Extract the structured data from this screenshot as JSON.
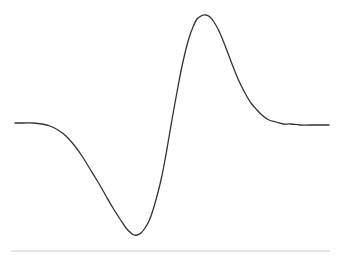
{
  "figure": {
    "background_color": "#ffffff",
    "width": 341,
    "height": 261,
    "title": "",
    "subtitle": ""
  },
  "curve": {
    "name": "wavelet-curve",
    "stroke_color": "#333333",
    "stroke_width": 1.3,
    "style": "solid"
  },
  "baseline": {
    "name": "baseline-rule",
    "stroke_color": "#cccccc",
    "stroke_width": 1,
    "x_start": 11,
    "x_end": 330,
    "y": 251
  },
  "chart_data": {
    "type": "line",
    "title": "",
    "subtitle": "",
    "xlabel": "",
    "ylabel": "",
    "grid": false,
    "legend": null,
    "axes_visible": false,
    "xlim": [
      0,
      341
    ],
    "ylim": [
      261,
      0
    ],
    "annotations": [],
    "series": [
      {
        "name": "wavelet",
        "description": "derivative-of-gaussian style wavelet: flat left plateau, deep trough, steep rise, tall peak, decay to flat right plateau",
        "color": "#333333",
        "points": [
          [
            15,
            123
          ],
          [
            24,
            123
          ],
          [
            33,
            123
          ],
          [
            42,
            124
          ],
          [
            50,
            126
          ],
          [
            58,
            130
          ],
          [
            66,
            136
          ],
          [
            74,
            145
          ],
          [
            82,
            156
          ],
          [
            90,
            169
          ],
          [
            98,
            182
          ],
          [
            106,
            196
          ],
          [
            113,
            208
          ],
          [
            120,
            219
          ],
          [
            126,
            228
          ],
          [
            131,
            233
          ],
          [
            134,
            235
          ],
          [
            137,
            235
          ],
          [
            141,
            233
          ],
          [
            145,
            228
          ],
          [
            149,
            221
          ],
          [
            153,
            210
          ],
          [
            157,
            196
          ],
          [
            161,
            180
          ],
          [
            165,
            160
          ],
          [
            169,
            137
          ],
          [
            173,
            114
          ],
          [
            177,
            92
          ],
          [
            181,
            71
          ],
          [
            185,
            53
          ],
          [
            189,
            38
          ],
          [
            193,
            27
          ],
          [
            197,
            19
          ],
          [
            201,
            16
          ],
          [
            206,
            15
          ],
          [
            210,
            17
          ],
          [
            214,
            22
          ],
          [
            219,
            31
          ],
          [
            224,
            43
          ],
          [
            229,
            56
          ],
          [
            234,
            69
          ],
          [
            239,
            81
          ],
          [
            245,
            93
          ],
          [
            251,
            103
          ],
          [
            257,
            110
          ],
          [
            263,
            116
          ],
          [
            269,
            120
          ],
          [
            276,
            122
          ],
          [
            283,
            124
          ],
          [
            291,
            124
          ],
          [
            300,
            125
          ],
          [
            310,
            125
          ],
          [
            320,
            125
          ],
          [
            329,
            125
          ]
        ]
      }
    ],
    "features": {
      "left_plateau_y": 123,
      "trough_x": 134,
      "trough_y": 235,
      "zero_crossing_x": 169,
      "peak_x": 206,
      "peak_y": 15,
      "right_plateau_y": 125
    }
  }
}
